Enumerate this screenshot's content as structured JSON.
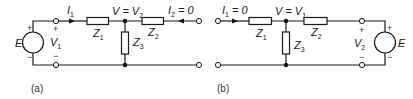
{
  "figure": {
    "circuit_a": {
      "caption": "(a)",
      "source": {
        "label": "E",
        "plus": "+",
        "minus": "−"
      },
      "port1_voltage": {
        "label": "V",
        "sub": "1",
        "plus": "+",
        "minus": "−"
      },
      "current_in": {
        "label": "I",
        "sub": "1"
      },
      "node_label": {
        "left": "V = V",
        "sub": "2"
      },
      "current_out": {
        "label": "I",
        "sub": "2",
        "suffix": " = 0"
      },
      "z1": {
        "label": "Z",
        "sub": "1"
      },
      "z2": {
        "label": "Z",
        "sub": "2"
      },
      "z3": {
        "label": "Z",
        "sub": "3"
      }
    },
    "circuit_b": {
      "caption": "(b)",
      "source": {
        "label": "E",
        "plus": "+",
        "minus": "−"
      },
      "port2_voltage": {
        "label": "V",
        "sub": "2",
        "plus": "+",
        "minus": "−"
      },
      "current_in": {
        "label": "I",
        "sub": "1",
        "suffix": " = 0"
      },
      "node_label": {
        "left": "V = V",
        "sub": "1"
      },
      "z1": {
        "label": "Z",
        "sub": "1"
      },
      "z2": {
        "label": "Z",
        "sub": "2"
      },
      "z3": {
        "label": "Z",
        "sub": "3"
      }
    }
  }
}
